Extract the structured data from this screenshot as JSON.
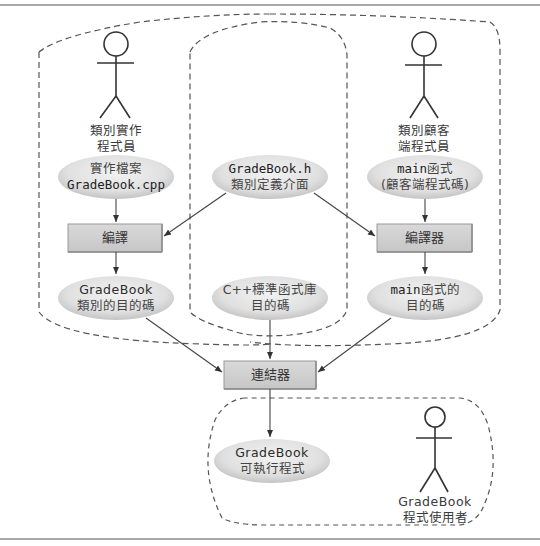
{
  "colors": {
    "ellipse_fill_center": "#eeeeee",
    "ellipse_fill_edge": "#c9c9c9",
    "box_fill": "#cfcfcf",
    "box_border": "#9a9a9a",
    "line": "#444444",
    "dashed": "#555555",
    "frame_line": "#8a8a8a"
  },
  "actors": {
    "implementer": {
      "line1": "類別實作",
      "line2": "程式員"
    },
    "client": {
      "line1": "類別顧客",
      "line2": "端程式員"
    },
    "user": {
      "line1": "GradeBook",
      "line2": "程式使用者"
    }
  },
  "nodes": {
    "impl_file": {
      "line1": "實作檔案",
      "line2": "GradeBook.cpp"
    },
    "header_file": {
      "line1": "GradeBook.h",
      "line2": "類別定義介面"
    },
    "main_file": {
      "line1_code": "main",
      "line1_zh": "函式",
      "line2": "(顧客端程式碼)"
    },
    "gradebook_obj": {
      "line1": "GradeBook",
      "line2": "類別的目的碼"
    },
    "stdlib_obj": {
      "line1": "C++標準函式庫",
      "line2": "目的碼"
    },
    "main_obj": {
      "line1_code": "main",
      "line1_zh": "函式的",
      "line2": "目的碼"
    },
    "executable": {
      "line1": "GradeBook",
      "line2": "可執行程式"
    }
  },
  "boxes": {
    "compile_left": "編譯",
    "compile_right": "編譯器",
    "linker": "連結器"
  }
}
